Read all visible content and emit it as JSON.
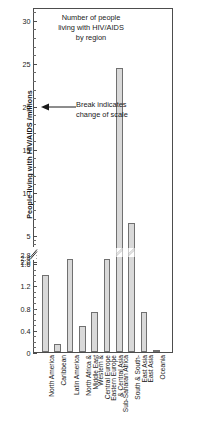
{
  "chart_data": {
    "type": "bar",
    "title_lines": [
      "Number of people",
      "living with HIV/AIDS",
      "by region"
    ],
    "xlabel": "",
    "ylabel": "People living with HIV/AIDS /millions",
    "annotation": "Break indicates change of scale",
    "annotation_lines": [
      "Break indicates",
      "change of scale"
    ],
    "broken_axis": true,
    "lower_ylim": [
      0,
      1.8
    ],
    "upper_ylim": [
      3.0,
      31.5
    ],
    "lower_ticks": [
      "0",
      "0.4",
      "0.8",
      "1.2",
      "1.6"
    ],
    "upper_ticks": [
      "2.0",
      "2.4",
      "2.8",
      "5",
      "10",
      "15",
      "20",
      "25",
      "30"
    ],
    "grid": false,
    "legend": null,
    "bar_color": "#d9d9d9",
    "bar_edge_color": "#707070",
    "categories": [
      "North America",
      "Caribbean",
      "Latin America",
      "North Africa & Middle East",
      "Western & Central Europe",
      "Eastern Europe & Central Asia",
      "Sub-Saharan Africa",
      "South & South-East Asia",
      "East Asia",
      "Oceania"
    ],
    "category_lines": [
      [
        "North America"
      ],
      [
        "Caribbean"
      ],
      [
        "Latin America"
      ],
      [
        "North Africa &",
        "Middle East"
      ],
      [
        "Western &",
        "Central Europe"
      ],
      [
        "Eastern Europe",
        "& Central Asia"
      ],
      [
        "Sub-Saharan Africa"
      ],
      [
        "South & South-",
        "East Asia"
      ],
      [
        "East Asia"
      ],
      [
        "Oceania"
      ]
    ],
    "values": [
      1.4,
      0.16,
      1.7,
      0.49,
      0.73,
      1.7,
      24.5,
      6.5,
      0.74,
      0.05
    ],
    "units": "millions"
  }
}
